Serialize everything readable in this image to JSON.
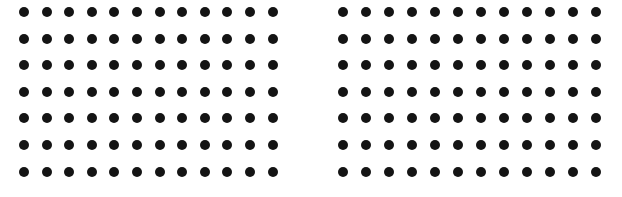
{
  "colors": {
    "background": "#ffffff",
    "dot": "#141414"
  },
  "grids": [
    {
      "name": "left-dot-grid",
      "rows": 7,
      "cols": 12,
      "x0": 24,
      "y0": 12,
      "dx": 22.6,
      "dy": 26.6
    },
    {
      "name": "right-dot-grid",
      "rows": 7,
      "cols": 12,
      "x0": 343,
      "y0": 12,
      "dx": 23.0,
      "dy": 26.6
    }
  ]
}
